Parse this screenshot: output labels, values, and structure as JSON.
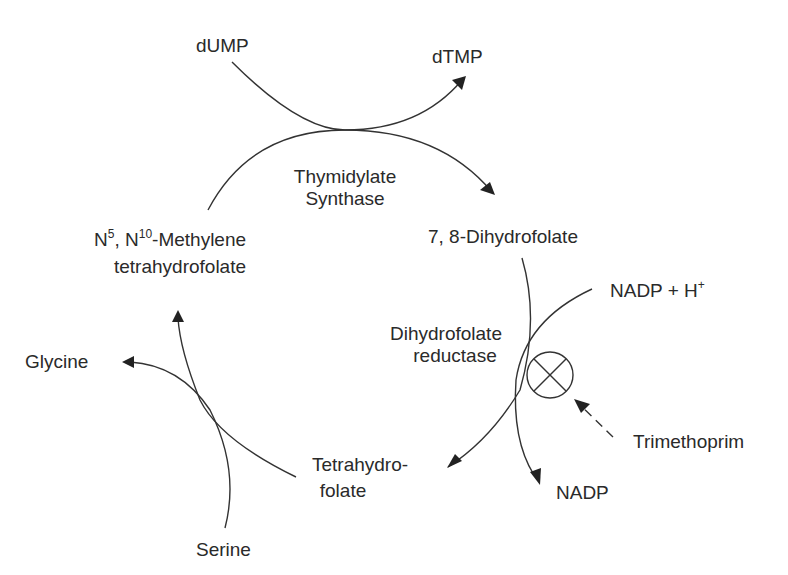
{
  "diagram": {
    "type": "metabolic-pathway",
    "colors": {
      "line": "#333333",
      "text": "#2a2a2a",
      "background": "#ffffff"
    },
    "nodes": {
      "dump": "dUMP",
      "dtmp": "dTMP",
      "thymidylate_synthase": [
        "Thymidylate",
        "Synthase"
      ],
      "dihydrofolate": "7, 8-Dihydrofolate",
      "methylene_thf": {
        "n": "N",
        "sup1": "5",
        "mid": ", N",
        "sup2": "10",
        "rest": "-Methylene",
        "line2": "tetrahydrofolate"
      },
      "nadph": {
        "base": "NADP + H",
        "sup": "+"
      },
      "dhfr": [
        "Dihydrofolate",
        "reductase"
      ],
      "glycine": "Glycine",
      "tetrahydrofolate": [
        "Tetrahydro-",
        "folate"
      ],
      "nadp": "NADP",
      "trimethoprim": "Trimethoprim",
      "serine": "Serine"
    },
    "edges": [
      {
        "from": "dUMP",
        "to": "dTMP",
        "via": "Thymidylate Synthase"
      },
      {
        "from": "N5, N10-Methylene tetrahydrofolate",
        "to": "7, 8-Dihydrofolate",
        "via": "Thymidylate Synthase"
      },
      {
        "from": "7, 8-Dihydrofolate",
        "to": "Tetrahydrofolate",
        "via": "Dihydrofolate reductase"
      },
      {
        "from": "NADP + H+",
        "to": "NADP",
        "via": "Dihydrofolate reductase"
      },
      {
        "from": "Tetrahydrofolate",
        "to": "N5, N10-Methylene tetrahydrofolate"
      },
      {
        "from": "Serine",
        "to": "Glycine"
      },
      {
        "from": "Trimethoprim",
        "to": "Dihydrofolate reductase",
        "style": "dashed",
        "meaning": "inhibition"
      }
    ],
    "inhibition_symbol": "circle-with-x"
  }
}
